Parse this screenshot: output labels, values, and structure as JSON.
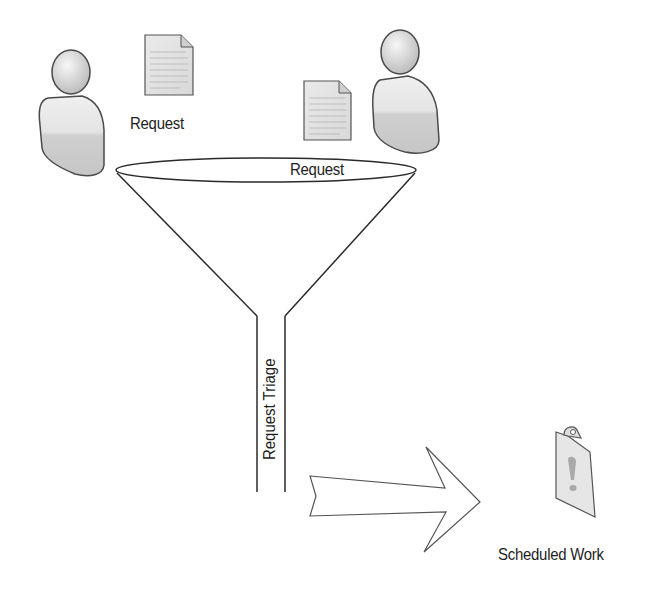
{
  "diagram": {
    "nodes": [
      {
        "id": "requester-1",
        "type": "person-icon"
      },
      {
        "id": "request-doc-1",
        "type": "document-icon",
        "label": "Request"
      },
      {
        "id": "requester-2",
        "type": "person-icon"
      },
      {
        "id": "request-doc-2",
        "type": "document-icon"
      },
      {
        "id": "funnel",
        "type": "funnel",
        "mouth_label": "Request",
        "neck_label": "Request Triage"
      },
      {
        "id": "flow-arrow",
        "type": "block-arrow-right"
      },
      {
        "id": "scheduled-work",
        "type": "clipboard-alert-icon",
        "label": "Scheduled Work"
      }
    ],
    "labels": {
      "request_left": "Request",
      "request_funnel": "Request",
      "triage": "Request Triage",
      "scheduled": "Scheduled Work"
    },
    "colors": {
      "stroke": "#2a2a2a",
      "icon_fill": "#e2e2e2",
      "icon_shade": "#c4c4c4",
      "text": "#1e1e1e",
      "background": "#ffffff"
    }
  }
}
